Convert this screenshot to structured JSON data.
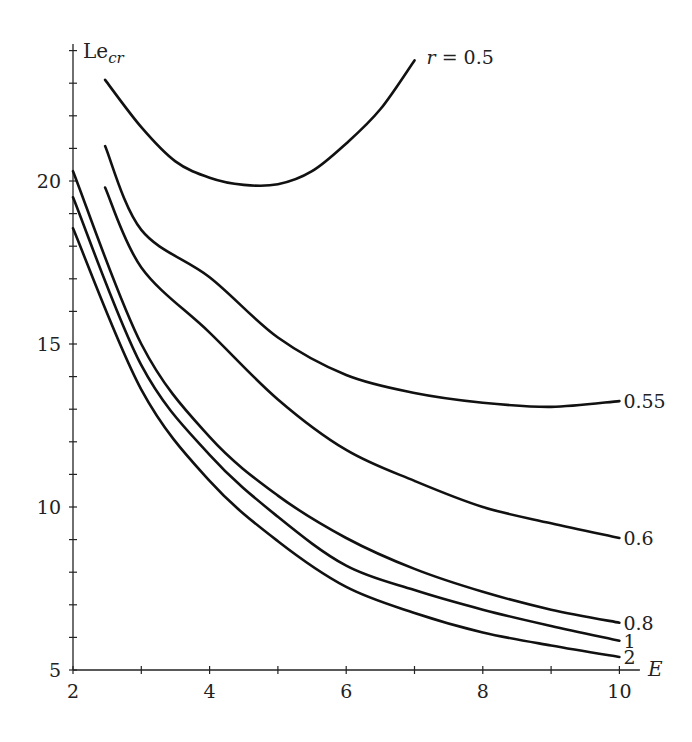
{
  "chart_data": {
    "type": "line",
    "title": "",
    "xlabel": "E",
    "ylabel": "Le_cr",
    "ylabel_main": "Le",
    "ylabel_sub": "cr",
    "xlim": [
      2,
      10.3
    ],
    "ylim": [
      5,
      24.2
    ],
    "xticks": [
      2,
      4,
      6,
      8,
      10
    ],
    "xminor_ticks": [
      3,
      5,
      7,
      9
    ],
    "yticks": [
      5,
      10,
      15,
      20
    ],
    "yminor_step": 1,
    "grid": false,
    "legend": "inline labels at curve ends",
    "series": [
      {
        "name": "r = 0.5",
        "label": "r = 0.5",
        "label_prefix": "r",
        "label_value": " = 0.5",
        "x": [
          2.47,
          3.0,
          3.5,
          4.0,
          4.5,
          5.0,
          5.5,
          6.0,
          6.5,
          7.0
        ],
        "y": [
          23.1,
          21.65,
          20.6,
          20.1,
          19.88,
          19.9,
          20.3,
          21.15,
          22.2,
          23.7
        ]
      },
      {
        "name": "0.55",
        "label": "0.55",
        "x": [
          2.47,
          3.0,
          4.0,
          5.0,
          6.0,
          7.0,
          8.0,
          9.0,
          10.0
        ],
        "y": [
          21.07,
          18.5,
          17.05,
          15.2,
          14.05,
          13.5,
          13.2,
          13.07,
          13.25
        ]
      },
      {
        "name": "0.6",
        "label": "0.6",
        "x": [
          2.47,
          3.0,
          4.0,
          5.0,
          6.0,
          7.0,
          8.0,
          9.0,
          10.0
        ],
        "y": [
          19.8,
          17.35,
          15.35,
          13.3,
          11.75,
          10.8,
          10.0,
          9.5,
          9.05
        ]
      },
      {
        "name": "0.8",
        "label": "0.8",
        "x": [
          2.0,
          3.0,
          4.0,
          5.0,
          6.0,
          7.0,
          8.0,
          9.0,
          10.0
        ],
        "y": [
          20.3,
          15.0,
          12.15,
          10.35,
          9.05,
          8.1,
          7.4,
          6.85,
          6.45
        ]
      },
      {
        "name": "1",
        "label": "1",
        "x": [
          2.0,
          3.0,
          4.0,
          5.0,
          6.0,
          7.0,
          8.0,
          9.0,
          10.0
        ],
        "y": [
          19.5,
          14.35,
          11.6,
          9.7,
          8.2,
          7.45,
          6.85,
          6.35,
          5.9
        ]
      },
      {
        "name": "2",
        "label": "2",
        "x": [
          2.0,
          3.0,
          4.0,
          5.0,
          6.0,
          7.0,
          8.0,
          9.0,
          10.0
        ],
        "y": [
          18.55,
          13.6,
          10.8,
          8.95,
          7.55,
          6.75,
          6.15,
          5.75,
          5.4
        ]
      }
    ]
  }
}
